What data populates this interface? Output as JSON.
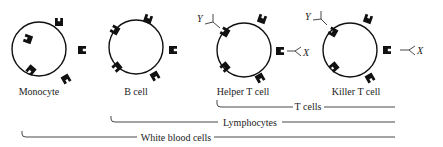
{
  "cells": [
    {
      "label": "Monocyte",
      "cx": 39,
      "cy": 49
    },
    {
      "label": "B cell",
      "cx": 136,
      "cy": 47
    },
    {
      "label": "Helper T cell",
      "cx": 244,
      "cy": 50
    },
    {
      "label": "Killer T cell",
      "cx": 350,
      "cy": 50
    }
  ],
  "antigen_labels": {
    "helper_y": "Y",
    "helper_x": "X",
    "killer_y": "Y",
    "killer_x": "X"
  },
  "groups": [
    {
      "label": "T cells",
      "start_x": 216,
      "end_x": 395,
      "y": 106
    },
    {
      "label": "Lymphocytes",
      "start_x": 110,
      "end_x": 395,
      "y": 120
    },
    {
      "label": "White blood cells",
      "start_x": 21,
      "end_x": 395,
      "y": 135
    }
  ]
}
